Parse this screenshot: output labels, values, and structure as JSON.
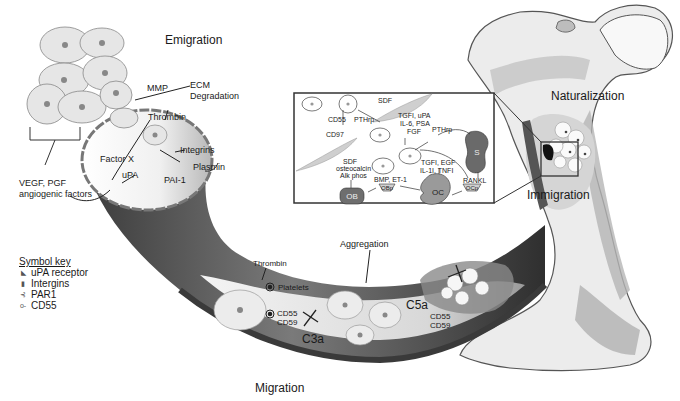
{
  "stages": {
    "emigration": "Emigration",
    "migration": "Migration",
    "aggregation": "Aggregation",
    "immigration": "Immigration",
    "naturalization": "Naturalization"
  },
  "emigration_labels": {
    "mmp": "MMP",
    "ecm": "ECM",
    "degradation": "Degradation",
    "thrombin": "Thrombin",
    "integrins": "Integrins",
    "factor_x": "Factor X",
    "upa": "uPA",
    "pai1": "PAI-1",
    "plasmin": "Plasmin",
    "vegf": "VEGF, PGF",
    "angiogenic": "angiogenic factors"
  },
  "migration_labels": {
    "thrombin": "Thrombin",
    "platelets": "Platelets",
    "cd55": "CD55",
    "cd59": "CD59",
    "c3a": "C3a",
    "c5a": "C5a",
    "cd55_b": "CD55",
    "cd59_b": "CD59"
  },
  "inset": {
    "sdf_top": "SDF",
    "cd55": "CD55",
    "pthrp_1": "PTHrp",
    "cd97": "CD97",
    "tgf_line1": "TGFI, uPA",
    "tgf_line2": "IL-6, PSA",
    "tgf_line3": "FGF",
    "pthrp_2": "PTHrp",
    "s_cell": "S",
    "sdf_line1": "SDF",
    "sdf_line2": "osteocalcin",
    "sdf_line3": "Alk phos",
    "bmp": "BMP, ET-1",
    "tgf2_line1": "TGFI, EGF",
    "tgf2_line2": "IL-1I, TNFI",
    "rankl": "RANKL",
    "ob": "OB",
    "obp": "OBp",
    "oc": "OC",
    "ocp": "OCp"
  },
  "symbol_key": {
    "title": "Symbol key",
    "items": [
      {
        "icon": "upa-receptor-icon",
        "glyph": "◣",
        "label": "uPA receptor"
      },
      {
        "icon": "integrin-icon",
        "glyph": "▮",
        "label": "Intergins"
      },
      {
        "icon": "par1-icon",
        "glyph": "⊰",
        "label": "PAR1"
      },
      {
        "icon": "cd55-icon",
        "glyph": "o-",
        "label": "CD55"
      }
    ]
  },
  "colors": {
    "vessel_dark": "#4a4a4a",
    "vessel_mid": "#8c8c8c",
    "cell_fill": "#e6e6e6",
    "bone_fill": "#e9e9e9",
    "bone_shade": "#a9a9a9",
    "ob_fill": "#6e6e6e",
    "oc_fill": "#9a9a9a"
  }
}
